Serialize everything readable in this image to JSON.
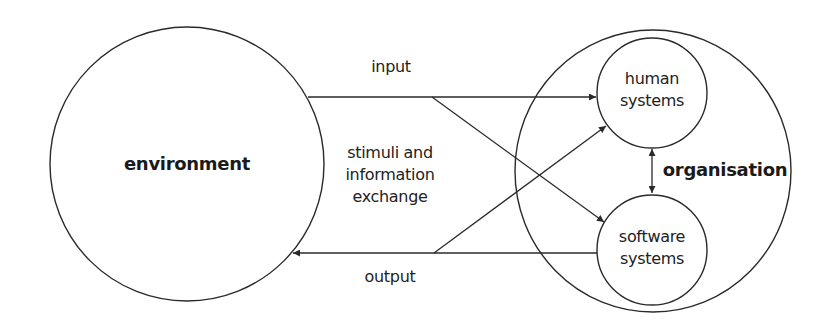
{
  "diagram": {
    "nodes": {
      "environment": {
        "label": "environment"
      },
      "organisation": {
        "label": "organisation"
      },
      "human_systems": {
        "line1": "human",
        "line2": "systems"
      },
      "software_systems": {
        "line1": "software",
        "line2": "systems"
      }
    },
    "edges": {
      "input": {
        "label": "input"
      },
      "output": {
        "label": "output"
      },
      "exchange": {
        "line1": "stimuli and",
        "line2": "information",
        "line3": "exchange"
      }
    },
    "colors": {
      "stroke": "#2a2a2a",
      "text": "#222222",
      "background": "#ffffff"
    }
  }
}
